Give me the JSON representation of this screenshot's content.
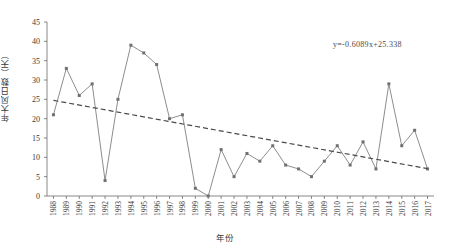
{
  "chart_data": {
    "type": "line",
    "title": "",
    "xlabel": "年份",
    "ylabel": "年大风日数（天）",
    "categories": [
      "1988",
      "1989",
      "1990",
      "1991",
      "1992",
      "1993",
      "1994",
      "1995",
      "1996",
      "1997",
      "1998",
      "1999",
      "2000",
      "2001",
      "2002",
      "2003",
      "2004",
      "2005",
      "2006",
      "2007",
      "2008",
      "2009",
      "2010",
      "2011",
      "2012",
      "2013",
      "2014",
      "2015",
      "2016",
      "2017"
    ],
    "values": [
      21,
      33,
      26,
      29,
      4,
      25,
      39,
      37,
      34,
      20,
      21,
      2,
      0,
      12,
      5,
      11,
      9,
      13,
      8,
      7,
      5,
      9,
      13,
      8,
      14,
      7,
      29,
      13,
      17,
      7
    ],
    "series": [
      {
        "name": "年大风日数",
        "values": [
          21,
          33,
          26,
          29,
          4,
          25,
          39,
          37,
          34,
          20,
          21,
          2,
          0,
          12,
          5,
          11,
          9,
          13,
          8,
          7,
          5,
          9,
          13,
          8,
          14,
          7,
          29,
          13,
          17,
          7
        ],
        "color": "#808080",
        "style": "solid-with-markers"
      },
      {
        "name": "线性趋势线",
        "type": "trendline",
        "equation": "y=-0.6089x+25.338",
        "slope": -0.6089,
        "intercept": 25.338,
        "color": "#4a4a4a",
        "style": "dashed"
      }
    ],
    "ylim": [
      0,
      45
    ],
    "ytick_values": [
      0,
      5,
      10,
      15,
      20,
      25,
      30,
      35,
      40,
      45
    ],
    "ytick_labels": [
      "0",
      "5",
      "10",
      "15",
      "20",
      "25",
      "30",
      "35",
      "40",
      "45"
    ],
    "grid": false,
    "legend": "none",
    "annotations": [
      {
        "text": "y=-0.6089x+25.338",
        "x_frac": 0.78,
        "y_value": 42
      }
    ]
  }
}
